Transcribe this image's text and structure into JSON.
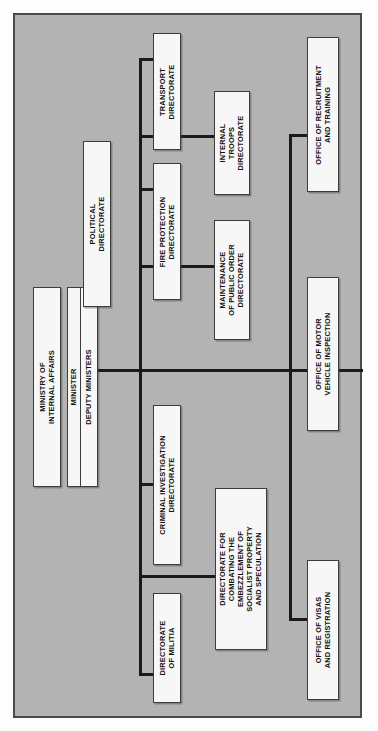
{
  "diagram": {
    "orientation": "rotated-90-ccw",
    "panel_color": "#b3b3b3",
    "box_color": "#f7f7f7",
    "line_color": "#1a1a1a",
    "border_color": "#4a4a4a"
  },
  "nodes": {
    "ministry": "MINISTRY OF\nINTERNAL AFFAIRS",
    "minister": "MINISTER",
    "deputy_ministers": "DEPUTY MINISTERS",
    "political": "POLITICAL\nDIRECTORATE",
    "transport": "TRANSPORT\nDIRECTORATE",
    "fire_protection": "FIRE PROTECTION\nDIRECTORATE",
    "internal_troops": "INTERNAL\nTROOPS\nDIRECTORATE",
    "public_order": "MAINTENANCE\nOF PUBLIC ORDER\nDIRECTORATE",
    "criminal_investigation": "CRIMINAL INVESTIGATION\nDIRECTORATE",
    "militia": "DIRECTORATE\nOF MILITIA",
    "embezzlement": "DIRECTORATE FOR\nCOMBATING THE\nEMBEZZLEMENT OF\nSOCIALIST PROPERTY\nAND SPECULATION",
    "recruitment": "OFFICE OF RECRUITMENT\nAND TRAINING",
    "motor_vehicle": "OFFICE OF MOTOR\nVEHICLE INSPECTION",
    "visas": "OFFICE OF VISAS\nAND REGISTRATION"
  }
}
